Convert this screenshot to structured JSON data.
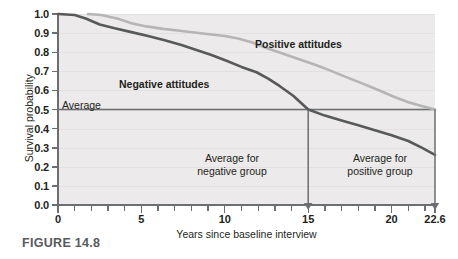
{
  "figure": {
    "caption": "FIGURE 14.8"
  },
  "chart_data": {
    "type": "line",
    "title": "",
    "xlabel": "Years since baseline interview",
    "ylabel": "Survival probability",
    "xlim": [
      0,
      22.6
    ],
    "ylim": [
      0.0,
      1.0
    ],
    "grid": true,
    "legend_position": "inline-annotations",
    "y_ticks": [
      "0.0",
      "0.1",
      "0.2",
      "0.3",
      "0.4",
      "0.5",
      "0.6",
      "0.7",
      "0.8",
      "0.9",
      "1.0"
    ],
    "y_tick_values": [
      0.0,
      0.1,
      0.2,
      0.3,
      0.4,
      0.5,
      0.6,
      0.7,
      0.8,
      0.9,
      1.0
    ],
    "x_ticks": [
      "0",
      "5",
      "10",
      "15",
      "20",
      "22.6"
    ],
    "x_tick_values": [
      0,
      5,
      10,
      15,
      20,
      22.6
    ],
    "x_minor_tick_values": [
      1,
      2,
      3,
      4,
      6,
      7,
      8,
      9,
      11,
      12,
      13,
      14,
      16,
      17,
      18,
      19,
      21,
      22
    ],
    "series": [
      {
        "name": "Negative attitudes",
        "color": "#58595b",
        "label_x": 7.3,
        "label_y": 0.655,
        "x": [
          0.0,
          1.0,
          1.7,
          2.5,
          3.4,
          4.4,
          5.4,
          6.4,
          7.4,
          8.3,
          9.2,
          10.1,
          11.0,
          11.9,
          12.6,
          13.3,
          14.1,
          15.0,
          16.0,
          17.0,
          18.0,
          19.0,
          20.0,
          21.0,
          21.8,
          22.6
        ],
        "y": [
          1.0,
          0.995,
          0.975,
          0.945,
          0.925,
          0.905,
          0.885,
          0.862,
          0.838,
          0.812,
          0.785,
          0.755,
          0.723,
          0.695,
          0.662,
          0.622,
          0.572,
          0.5,
          0.468,
          0.442,
          0.418,
          0.392,
          0.365,
          0.335,
          0.3,
          0.262
        ]
      },
      {
        "name": "Positive attitudes",
        "color": "#b5b5b5",
        "label_x": 11.9,
        "label_y": 0.815,
        "x": [
          1.8,
          2.6,
          3.6,
          4.4,
          5.3,
          6.3,
          7.3,
          8.3,
          9.2,
          10.0,
          10.8,
          11.6,
          12.5,
          13.5,
          14.5,
          15.5,
          16.3,
          17.2,
          18.2,
          19.2,
          20.1,
          21.0,
          21.8,
          22.6
        ],
        "y": [
          1.0,
          0.995,
          0.975,
          0.952,
          0.935,
          0.922,
          0.912,
          0.902,
          0.893,
          0.885,
          0.872,
          0.852,
          0.822,
          0.792,
          0.762,
          0.732,
          0.705,
          0.672,
          0.638,
          0.602,
          0.568,
          0.538,
          0.518,
          0.5
        ]
      }
    ],
    "reference_line": {
      "label": "Average",
      "value": 0.5,
      "orientation": "horizontal",
      "color": "#6d6e71"
    },
    "annotations": [
      {
        "name": "average-for-negative-group",
        "line1": "Average for",
        "line2": "negative group",
        "arrow_x": 15,
        "arrow_from_y": 0.5,
        "arrow_to_y": 0.0
      },
      {
        "name": "average-for-positive-group",
        "line1": "Average",
        "line2": "positive group",
        "line1_full": "Average for",
        "arrow_x": 22.6,
        "arrow_from_y": 0.5,
        "arrow_to_y": 0.0
      }
    ]
  }
}
